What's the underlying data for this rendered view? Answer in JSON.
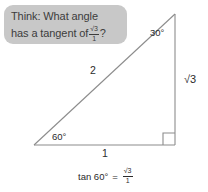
{
  "figure": {
    "type": "right-triangle-30-60-90",
    "hint_bubble": {
      "line1": "Think: What angle",
      "line2_prefix": "has a tangent of",
      "fraction": {
        "numerator": "√3",
        "denominator": "1"
      },
      "line2_suffix": "?",
      "background_color": "#c8c8c8",
      "text_color": "#3c3c3c"
    },
    "angles": {
      "top": "30°",
      "bottom_left": "60°",
      "bottom_right_marker": "right-angle"
    },
    "sides": {
      "hypotenuse": "2",
      "vertical": "√3",
      "horizontal": "1"
    },
    "equation": {
      "left": "tan 60°",
      "operator": "=",
      "fraction": {
        "numerator": "√3",
        "denominator": "1"
      }
    },
    "stroke_color": "#8c8c8c",
    "label_color": "#2b2b2b"
  }
}
